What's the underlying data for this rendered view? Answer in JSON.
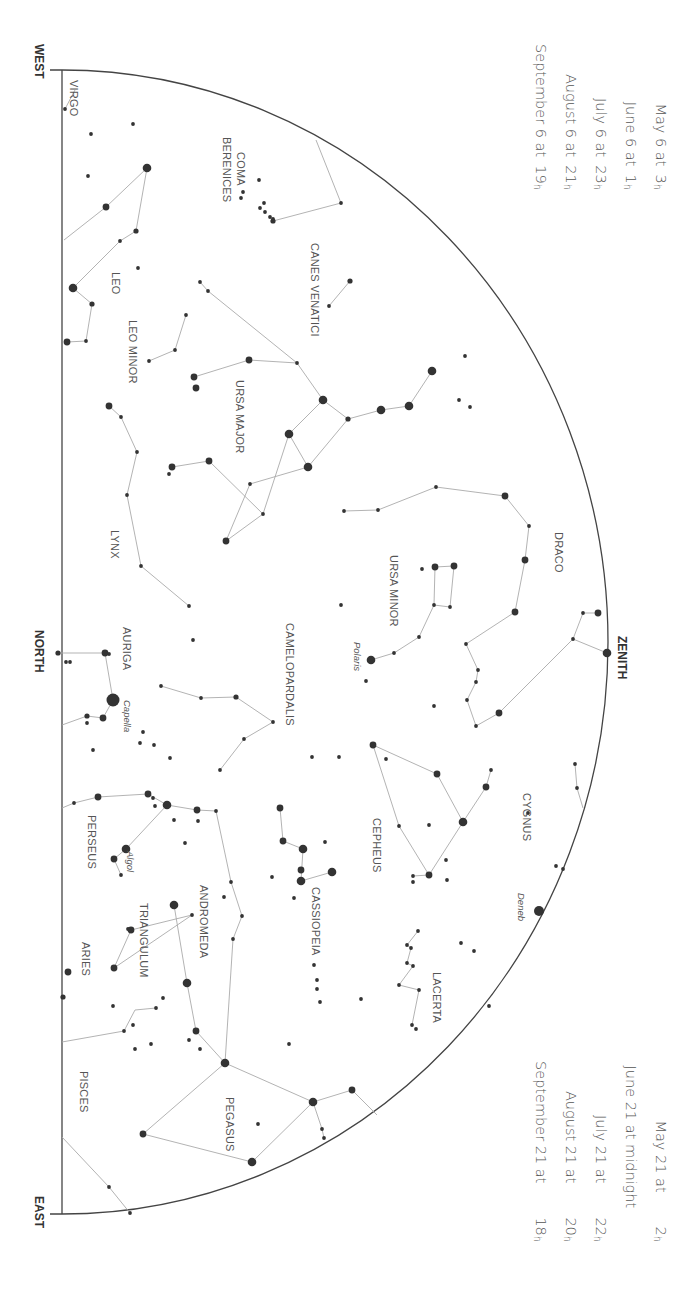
{
  "time_tables": {
    "upper_left": [
      {
        "date": "May 6 at",
        "hour": "3",
        "unit": "h"
      },
      {
        "date": "June 6 at",
        "hour": "1",
        "unit": "h"
      },
      {
        "date": "July 6 at",
        "hour": "23",
        "unit": "h"
      },
      {
        "date": "August 6 at",
        "hour": "21",
        "unit": "h"
      },
      {
        "date": "September 6 at",
        "hour": "19",
        "unit": "h"
      }
    ],
    "lower_right": [
      {
        "date": "May 21 at",
        "hour": "2",
        "unit": "h"
      },
      {
        "date": "June 21 at midnight",
        "hour": "",
        "unit": ""
      },
      {
        "date": "July 21 at",
        "hour": "22",
        "unit": "h"
      },
      {
        "date": "August 21 at",
        "hour": "20",
        "unit": "h"
      },
      {
        "date": "September 21 at",
        "hour": "18",
        "unit": "h"
      }
    ]
  },
  "directions": {
    "west": "WEST",
    "north": "NORTH",
    "east": "EAST",
    "zenith": "ZENITH"
  },
  "constellations": [
    {
      "name": "VIRGO",
      "x": 80,
      "y": 80
    },
    {
      "name": "COMA",
      "x": 247,
      "y": 152
    },
    {
      "name": "BERENICES",
      "x": 233,
      "y": 137
    },
    {
      "name": "CANES VENATICI",
      "x": 321,
      "y": 243
    },
    {
      "name": "LEO",
      "x": 122,
      "y": 272
    },
    {
      "name": "LEO MINOR",
      "x": 139,
      "y": 320
    },
    {
      "name": "URSA MAJOR",
      "x": 246,
      "y": 380
    },
    {
      "name": "LYNX",
      "x": 121,
      "y": 530
    },
    {
      "name": "DRACO",
      "x": 565,
      "y": 532
    },
    {
      "name": "URSA MINOR",
      "x": 400,
      "y": 555
    },
    {
      "name": "AURIGA",
      "x": 133,
      "y": 627
    },
    {
      "name": "CAMELOPARDALIS",
      "x": 296,
      "y": 623
    },
    {
      "name": "CYGNUS",
      "x": 533,
      "y": 793
    },
    {
      "name": "CEPHEUS",
      "x": 383,
      "y": 818
    },
    {
      "name": "PERSEUS",
      "x": 98,
      "y": 815
    },
    {
      "name": "CASSIOPEIA",
      "x": 322,
      "y": 887
    },
    {
      "name": "ANDROMEDA",
      "x": 210,
      "y": 885
    },
    {
      "name": "TRIANGULUM",
      "x": 150,
      "y": 903
    },
    {
      "name": "ARIES",
      "x": 92,
      "y": 942
    },
    {
      "name": "LACERTA",
      "x": 443,
      "y": 972
    },
    {
      "name": "PISCES",
      "x": 90,
      "y": 1071
    },
    {
      "name": "PEGASUS",
      "x": 236,
      "y": 1097
    }
  ],
  "named_stars": [
    {
      "name": "Polaris",
      "x": 363,
      "y": 642
    },
    {
      "name": "Capella",
      "x": 133,
      "y": 700
    },
    {
      "name": "Algol",
      "x": 136,
      "y": 851
    },
    {
      "name": "Deneb",
      "x": 527,
      "y": 893
    }
  ],
  "stars": [
    [
      65,
      109,
      2
    ],
    [
      91,
      134,
      2
    ],
    [
      133,
      124,
      2
    ],
    [
      88,
      176,
      2
    ],
    [
      147,
      168,
      5
    ],
    [
      106,
      207,
      4
    ],
    [
      120,
      241,
      2
    ],
    [
      136,
      231,
      3
    ],
    [
      138,
      268,
      2
    ],
    [
      73,
      288,
      5
    ],
    [
      92,
      304,
      3
    ],
    [
      86,
      341,
      2
    ],
    [
      67,
      342,
      4
    ],
    [
      259,
      180,
      2
    ],
    [
      241,
      198,
      2
    ],
    [
      264,
      203,
      2
    ],
    [
      265,
      212,
      2
    ],
    [
      270,
      217,
      2
    ],
    [
      273,
      219,
      2
    ],
    [
      260,
      208,
      2
    ],
    [
      243,
      192,
      2
    ],
    [
      341,
      203,
      2
    ],
    [
      273,
      221,
      3
    ],
    [
      350,
      281,
      3
    ],
    [
      329,
      306,
      2
    ],
    [
      200,
      282,
      2
    ],
    [
      208,
      291,
      2
    ],
    [
      186,
      315,
      2
    ],
    [
      175,
      350,
      2
    ],
    [
      149,
      361,
      2
    ],
    [
      194,
      377,
      4
    ],
    [
      196,
      388,
      4
    ],
    [
      249,
      360,
      4
    ],
    [
      297,
      363,
      2
    ],
    [
      323,
      400,
      5
    ],
    [
      348,
      419,
      3
    ],
    [
      381,
      410,
      5
    ],
    [
      409,
      406,
      5
    ],
    [
      432,
      371,
      5
    ],
    [
      465,
      356,
      2
    ],
    [
      459,
      400,
      2
    ],
    [
      470,
      407,
      2
    ],
    [
      289,
      434,
      5
    ],
    [
      308,
      467,
      5
    ],
    [
      209,
      461,
      4
    ],
    [
      172,
      467,
      4
    ],
    [
      169,
      474,
      2
    ],
    [
      250,
      484,
      2
    ],
    [
      263,
      514,
      2
    ],
    [
      226,
      541,
      4
    ],
    [
      109,
      406,
      4
    ],
    [
      121,
      417,
      2
    ],
    [
      137,
      452,
      2
    ],
    [
      127,
      495,
      2
    ],
    [
      141,
      566,
      2
    ],
    [
      189,
      606,
      2
    ],
    [
      193,
      640,
      2
    ],
    [
      344,
      511,
      2
    ],
    [
      378,
      510,
      2
    ],
    [
      436,
      487,
      2
    ],
    [
      505,
      496,
      4
    ],
    [
      529,
      526,
      2
    ],
    [
      525,
      560,
      4
    ],
    [
      515,
      612,
      4
    ],
    [
      466,
      644,
      2
    ],
    [
      478,
      670,
      2
    ],
    [
      476,
      682,
      2
    ],
    [
      467,
      700,
      2
    ],
    [
      476,
      726,
      2
    ],
    [
      499,
      713,
      4
    ],
    [
      583,
      613,
      2
    ],
    [
      573,
      639,
      2
    ],
    [
      598,
      613,
      4
    ],
    [
      607,
      653,
      5
    ],
    [
      435,
      567,
      4
    ],
    [
      454,
      566,
      4
    ],
    [
      422,
      569,
      2
    ],
    [
      434,
      605,
      2
    ],
    [
      450,
      607,
      2
    ],
    [
      341,
      605,
      2
    ],
    [
      419,
      637,
      2
    ],
    [
      394,
      653,
      2
    ],
    [
      371,
      660,
      5
    ],
    [
      366,
      681,
      2
    ],
    [
      434,
      706,
      2
    ],
    [
      58,
      653,
      3
    ],
    [
      66,
      662,
      2
    ],
    [
      70,
      662,
      2
    ],
    [
      105,
      653,
      4
    ],
    [
      109,
      654,
      2
    ],
    [
      113,
      700,
      8
    ],
    [
      103,
      718,
      4
    ],
    [
      87,
      716,
      3
    ],
    [
      87,
      723,
      2
    ],
    [
      93,
      750,
      2
    ],
    [
      161,
      686,
      2
    ],
    [
      201,
      698,
      2
    ],
    [
      236,
      697,
      3
    ],
    [
      273,
      722,
      2
    ],
    [
      244,
      739,
      2
    ],
    [
      220,
      770,
      2
    ],
    [
      339,
      757,
      2
    ],
    [
      312,
      757,
      2
    ],
    [
      143,
      732,
      2
    ],
    [
      140,
      743,
      2
    ],
    [
      154,
      745,
      2
    ],
    [
      170,
      758,
      2
    ],
    [
      74,
      803,
      2
    ],
    [
      98,
      797,
      4
    ],
    [
      148,
      794,
      4
    ],
    [
      153,
      798,
      2
    ],
    [
      155,
      806,
      2
    ],
    [
      167,
      805,
      5
    ],
    [
      197,
      810,
      4
    ],
    [
      216,
      811,
      2
    ],
    [
      174,
      820,
      2
    ],
    [
      198,
      821,
      2
    ],
    [
      185,
      843,
      2
    ],
    [
      126,
      849,
      5
    ],
    [
      114,
      859,
      4
    ],
    [
      121,
      875,
      2
    ],
    [
      231,
      882,
      2
    ],
    [
      280,
      808,
      4
    ],
    [
      283,
      841,
      4
    ],
    [
      303,
      849,
      5
    ],
    [
      301,
      870,
      4
    ],
    [
      301,
      881,
      5
    ],
    [
      332,
      872,
      5
    ],
    [
      325,
      842,
      2
    ],
    [
      272,
      877,
      2
    ],
    [
      294,
      898,
      2
    ],
    [
      314,
      965,
      2
    ],
    [
      317,
      980,
      2
    ],
    [
      317,
      989,
      2
    ],
    [
      174,
      905,
      5
    ],
    [
      224,
      897,
      2
    ],
    [
      242,
      916,
      2
    ],
    [
      233,
      939,
      2
    ],
    [
      192,
      915,
      2
    ],
    [
      128,
      929,
      2
    ],
    [
      131,
      930,
      4
    ],
    [
      114,
      968,
      4
    ],
    [
      163,
      998,
      2
    ],
    [
      187,
      983,
      5
    ],
    [
      68,
      972,
      4
    ],
    [
      63,
      997,
      3
    ],
    [
      373,
      745,
      4
    ],
    [
      386,
      759,
      2
    ],
    [
      437,
      774,
      4
    ],
    [
      486,
      787,
      4
    ],
    [
      491,
      770,
      2
    ],
    [
      463,
      822,
      5
    ],
    [
      528,
      813,
      2
    ],
    [
      399,
      826,
      2
    ],
    [
      429,
      825,
      2
    ],
    [
      446,
      860,
      2
    ],
    [
      447,
      880,
      2
    ],
    [
      429,
      875,
      4
    ],
    [
      413,
      876,
      2
    ],
    [
      413,
      882,
      2
    ],
    [
      575,
      764,
      2
    ],
    [
      577,
      788,
      2
    ],
    [
      556,
      866,
      2
    ],
    [
      563,
      869,
      2
    ],
    [
      539,
      911,
      6
    ],
    [
      418,
      931,
      2
    ],
    [
      407,
      945,
      2
    ],
    [
      411,
      948,
      2
    ],
    [
      407,
      963,
      2
    ],
    [
      413,
      966,
      2
    ],
    [
      461,
      943,
      2
    ],
    [
      474,
      951,
      2
    ],
    [
      361,
      999,
      2
    ],
    [
      399,
      985,
      2
    ],
    [
      419,
      990,
      2
    ],
    [
      412,
      1025,
      2
    ],
    [
      416,
      1029,
      2
    ],
    [
      113,
      1006,
      2
    ],
    [
      133,
      1025,
      2
    ],
    [
      156,
      1008,
      2
    ],
    [
      124,
      1031,
      2
    ],
    [
      135,
      1049,
      2
    ],
    [
      196,
      1031,
      4
    ],
    [
      189,
      1040,
      2
    ],
    [
      225,
      1063,
      5
    ],
    [
      252,
      1162,
      5
    ],
    [
      289,
      1044,
      2
    ],
    [
      313,
      1102,
      5
    ],
    [
      352,
      1090,
      4
    ],
    [
      322,
      1129,
      2
    ],
    [
      324,
      1138,
      2
    ],
    [
      258,
      1124,
      2
    ],
    [
      143,
      1134,
      4
    ],
    [
      109,
      1187,
      2
    ],
    [
      130,
      1213,
      2
    ],
    [
      200,
      1049,
      2
    ],
    [
      151,
      1044,
      2
    ],
    [
      320,
      1002,
      2
    ],
    [
      489,
      1006,
      2
    ]
  ],
  "lines": [
    [
      [
        65,
        109
      ],
      [
        75,
        90
      ]
    ],
    [
      [
        147,
        168
      ],
      [
        106,
        207
      ],
      [
        64,
        240
      ]
    ],
    [
      [
        147,
        168
      ],
      [
        136,
        231
      ],
      [
        120,
        241
      ],
      [
        73,
        288
      ],
      [
        92,
        304
      ],
      [
        86,
        341
      ],
      [
        67,
        342
      ]
    ],
    [
      [
        273,
        221
      ],
      [
        341,
        203
      ],
      [
        316,
        140
      ]
    ],
    [
      [
        350,
        281
      ],
      [
        329,
        306
      ]
    ],
    [
      [
        200,
        282
      ],
      [
        208,
        291
      ],
      [
        297,
        363
      ],
      [
        323,
        400
      ]
    ],
    [
      [
        194,
        377
      ],
      [
        249,
        360
      ],
      [
        297,
        363
      ]
    ],
    [
      [
        323,
        400
      ],
      [
        348,
        419
      ],
      [
        381,
        410
      ],
      [
        409,
        406
      ],
      [
        432,
        371
      ]
    ],
    [
      [
        348,
        419
      ],
      [
        308,
        467
      ],
      [
        250,
        484
      ],
      [
        226,
        541
      ]
    ],
    [
      [
        323,
        400
      ],
      [
        289,
        434
      ],
      [
        308,
        467
      ]
    ],
    [
      [
        289,
        434
      ],
      [
        263,
        514
      ],
      [
        226,
        541
      ]
    ],
    [
      [
        172,
        467
      ],
      [
        209,
        461
      ],
      [
        263,
        514
      ]
    ],
    [
      [
        186,
        315
      ],
      [
        175,
        350
      ],
      [
        149,
        361
      ]
    ],
    [
      [
        109,
        406
      ],
      [
        121,
        417
      ],
      [
        137,
        452
      ],
      [
        127,
        495
      ],
      [
        141,
        566
      ],
      [
        189,
        606
      ]
    ],
    [
      [
        344,
        511
      ],
      [
        378,
        510
      ],
      [
        436,
        487
      ],
      [
        505,
        496
      ],
      [
        529,
        526
      ],
      [
        525,
        560
      ],
      [
        515,
        612
      ],
      [
        466,
        644
      ],
      [
        478,
        670
      ]
    ],
    [
      [
        478,
        670
      ],
      [
        476,
        682
      ],
      [
        467,
        700
      ],
      [
        476,
        726
      ],
      [
        499,
        713
      ],
      [
        573,
        639
      ],
      [
        583,
        613
      ],
      [
        598,
        613
      ]
    ],
    [
      [
        573,
        639
      ],
      [
        607,
        653
      ]
    ],
    [
      [
        435,
        567
      ],
      [
        454,
        566
      ],
      [
        450,
        607
      ],
      [
        434,
        605
      ],
      [
        435,
        567
      ]
    ],
    [
      [
        434,
        605
      ],
      [
        419,
        637
      ],
      [
        394,
        653
      ],
      [
        371,
        660
      ]
    ],
    [
      [
        58,
        653
      ],
      [
        105,
        653
      ],
      [
        113,
        700
      ],
      [
        103,
        718
      ],
      [
        87,
        716
      ],
      [
        62,
        725
      ]
    ],
    [
      [
        161,
        686
      ],
      [
        201,
        698
      ],
      [
        236,
        697
      ],
      [
        273,
        722
      ],
      [
        244,
        739
      ],
      [
        220,
        770
      ]
    ],
    [
      [
        62,
        808
      ],
      [
        74,
        803
      ],
      [
        98,
        797
      ],
      [
        148,
        794
      ],
      [
        167,
        805
      ],
      [
        197,
        810
      ],
      [
        216,
        811
      ],
      [
        231,
        882
      ],
      [
        242,
        916
      ],
      [
        233,
        939
      ],
      [
        225,
        1063
      ]
    ],
    [
      [
        167,
        805
      ],
      [
        126,
        849
      ]
    ],
    [
      [
        126,
        849
      ],
      [
        114,
        859
      ],
      [
        121,
        875
      ]
    ],
    [
      [
        280,
        808
      ],
      [
        283,
        841
      ],
      [
        303,
        849
      ],
      [
        301,
        881
      ],
      [
        332,
        872
      ]
    ],
    [
      [
        192,
        915
      ],
      [
        131,
        930
      ],
      [
        114,
        968
      ],
      [
        192,
        915
      ]
    ],
    [
      [
        174,
        905
      ],
      [
        187,
        983
      ],
      [
        196,
        1031
      ],
      [
        225,
        1063
      ],
      [
        313,
        1102
      ],
      [
        352,
        1090
      ],
      [
        377,
        1115
      ]
    ],
    [
      [
        313,
        1102
      ],
      [
        252,
        1162
      ]
    ],
    [
      [
        225,
        1063
      ],
      [
        143,
        1134
      ],
      [
        252,
        1162
      ]
    ],
    [
      [
        313,
        1102
      ],
      [
        322,
        1129
      ],
      [
        324,
        1138
      ]
    ],
    [
      [
        62,
        1042
      ],
      [
        124,
        1031
      ],
      [
        135,
        1010
      ],
      [
        156,
        1008
      ]
    ],
    [
      [
        62,
        1137
      ],
      [
        109,
        1187
      ],
      [
        130,
        1213
      ]
    ],
    [
      [
        373,
        745
      ],
      [
        437,
        774
      ],
      [
        463,
        822
      ],
      [
        486,
        787
      ],
      [
        491,
        770
      ]
    ],
    [
      [
        373,
        745
      ],
      [
        399,
        826
      ],
      [
        429,
        875
      ],
      [
        463,
        822
      ]
    ],
    [
      [
        413,
        876
      ],
      [
        429,
        875
      ]
    ],
    [
      [
        575,
        764
      ],
      [
        577,
        788
      ],
      [
        583,
        808
      ]
    ],
    [
      [
        418,
        931
      ],
      [
        407,
        945
      ],
      [
        411,
        948
      ],
      [
        407,
        963
      ],
      [
        413,
        966
      ],
      [
        399,
        985
      ],
      [
        419,
        990
      ],
      [
        412,
        1025
      ]
    ]
  ]
}
